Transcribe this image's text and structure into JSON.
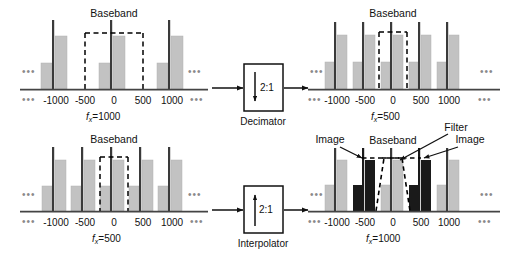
{
  "figure": {
    "type": "signal-processing-block-diagram"
  },
  "colors": {
    "bar_gray": "#c2c2c2",
    "bar_gray_edge": "#a9a9a9",
    "bar_black": "#1a1a1a",
    "line_dark": "#3a3a3a",
    "axis": "#444444",
    "dashed": "#000000",
    "ellipsis": "#8a8a8a"
  },
  "panels": [
    {
      "id": "top-left",
      "role": "decimator-input",
      "baseband_label": "Baseband",
      "rate_label": {
        "symbol": "f",
        "subscript": "x",
        "equals": "=",
        "value": "1000"
      },
      "ticks": [
        "-1000",
        "-500",
        "0",
        "500",
        "1000"
      ],
      "left_ellipsis": "•••",
      "right_ellipsis": "•••",
      "baseband_box": {
        "from": -500,
        "to": 500
      },
      "replicas": [
        {
          "center": -1000,
          "shade": "gray"
        },
        {
          "center": 0,
          "shade": "gray"
        },
        {
          "center": 1000,
          "shade": "gray"
        }
      ]
    },
    {
      "id": "top-right",
      "role": "decimator-output",
      "baseband_label": "Baseband",
      "rate_label": {
        "symbol": "f",
        "subscript": "x",
        "equals": "=",
        "value": "500"
      },
      "ticks": [
        "-1000",
        "-500",
        "0",
        "500",
        "1000"
      ],
      "left_ellipsis": "•••",
      "right_ellipsis": "•••",
      "baseband_box": {
        "from": -250,
        "to": 250
      },
      "replicas": [
        {
          "center": -1000,
          "shade": "gray"
        },
        {
          "center": -500,
          "shade": "gray"
        },
        {
          "center": 0,
          "shade": "gray"
        },
        {
          "center": 500,
          "shade": "gray"
        },
        {
          "center": 1000,
          "shade": "gray"
        }
      ]
    },
    {
      "id": "bottom-left",
      "role": "interpolator-input",
      "baseband_label": "Baseband",
      "rate_label": {
        "symbol": "f",
        "subscript": "x",
        "equals": "=",
        "value": "500"
      },
      "ticks": [
        "-1000",
        "-500",
        "0",
        "500",
        "1000"
      ],
      "left_ellipsis": "•••",
      "right_ellipsis": "•••",
      "baseband_box": {
        "from": -250,
        "to": 250
      },
      "replicas": [
        {
          "center": -1000,
          "shade": "gray"
        },
        {
          "center": -500,
          "shade": "gray"
        },
        {
          "center": 0,
          "shade": "gray"
        },
        {
          "center": 500,
          "shade": "gray"
        },
        {
          "center": 1000,
          "shade": "gray"
        }
      ]
    },
    {
      "id": "bottom-right",
      "role": "interpolator-output",
      "baseband_label": "Baseband",
      "filter_label": "Filter",
      "image_label_left": "Image",
      "image_label_right": "Image",
      "rate_label": {
        "symbol": "f",
        "subscript": "x",
        "equals": "=",
        "value": "1000"
      },
      "ticks": [
        "-1000",
        "-500",
        "0",
        "500",
        "1000"
      ],
      "left_ellipsis": "•••",
      "right_ellipsis": "•••",
      "baseband_box": {
        "from": -250,
        "to": 250
      },
      "filter_shape": "trapezoid",
      "replicas": [
        {
          "center": -1000,
          "shade": "gray"
        },
        {
          "center": -500,
          "shade": "black",
          "annotation": "Image"
        },
        {
          "center": 0,
          "shade": "gray",
          "annotation": "Baseband"
        },
        {
          "center": 500,
          "shade": "black",
          "annotation": "Image"
        },
        {
          "center": 1000,
          "shade": "gray"
        }
      ]
    }
  ],
  "blocks": [
    {
      "id": "decimator",
      "caption": "Decimator",
      "ratio": "2:1",
      "arrow": "down"
    },
    {
      "id": "interpolator",
      "caption": "Interpolator",
      "ratio": "2:1",
      "arrow": "up"
    }
  ]
}
